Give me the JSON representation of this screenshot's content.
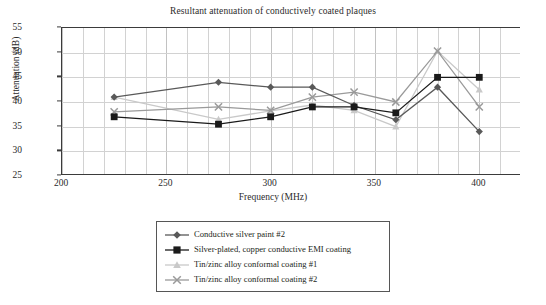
{
  "chart_data": {
    "type": "line",
    "title": "Resultant attenuation of conductively coated plaques",
    "xlabel": "Frequency (MHz)",
    "ylabel": "Attenuation (dB)",
    "xlim": [
      200,
      420
    ],
    "ylim": [
      25,
      55
    ],
    "xticks": [
      200,
      250,
      300,
      350,
      400
    ],
    "yticks": [
      25,
      30,
      35,
      40,
      45,
      50,
      55
    ],
    "grid": true,
    "minor_grid_x_step": 10,
    "legend_position": "below-center",
    "x": [
      225,
      275,
      300,
      320,
      340,
      360,
      380,
      400
    ],
    "series": [
      {
        "name": "Conductive silver paint #2",
        "marker": "diamond",
        "color": "#595959",
        "values": [
          41,
          44,
          43,
          43,
          39.3,
          36.4,
          43,
          34
        ]
      },
      {
        "name": "Silver-plated, copper conductive EMI coating",
        "marker": "square",
        "color": "#1a1a1a",
        "values": [
          37,
          35.5,
          37,
          39,
          39,
          37.8,
          45,
          45
        ]
      },
      {
        "name": "Tin/zinc alloy conformal coating #1",
        "marker": "triangle",
        "color": "#c9c9c9",
        "values": [
          41,
          36.5,
          38.2,
          39.4,
          38.3,
          35,
          50.3,
          42.5
        ]
      },
      {
        "name": "Tin/zinc alloy conformal coating #2",
        "marker": "x",
        "color": "#9a9a9a",
        "values": [
          38,
          39,
          38.3,
          41,
          42,
          40,
          50.3,
          39
        ]
      }
    ]
  },
  "legend": {
    "items": [
      {
        "label": "Conductive silver paint #2"
      },
      {
        "label": "Silver-plated, copper conductive EMI coating"
      },
      {
        "label": "Tin/zinc alloy conformal coating #1"
      },
      {
        "label": "Tin/zinc alloy conformal coating #2"
      }
    ]
  }
}
